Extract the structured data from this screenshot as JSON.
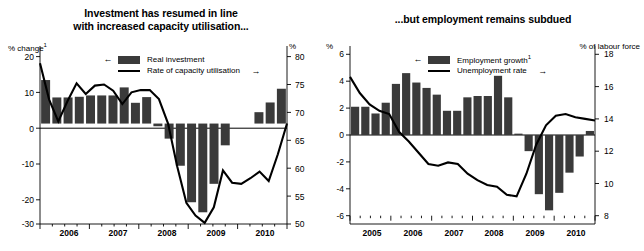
{
  "figure": {
    "background": "#ffffff",
    "bar_color": "#3a3a3a",
    "line_color": "#000000"
  },
  "chart_data": [
    {
      "type": "bar",
      "panel": "left",
      "title": "Investment has resumed in line with increased capacity utilisation...",
      "title_line1": "Investment has resumed in line",
      "title_line2": "with increased capacity utilisation...",
      "left_axis_label": "% change",
      "left_axis_label_sup": "1",
      "right_axis_label": "%",
      "left_ticks": [
        "20",
        "10",
        "0",
        "-10",
        "-20",
        "-30"
      ],
      "left_tick_values": [
        20,
        10,
        0,
        -10,
        -20,
        -30
      ],
      "right_ticks": [
        "80",
        "75",
        "70",
        "65",
        "60",
        "55",
        "50"
      ],
      "right_tick_values": [
        80,
        75,
        70,
        65,
        60,
        55,
        50
      ],
      "ylim": [
        -30,
        20
      ],
      "ylim_right": [
        50,
        80
      ],
      "xlabel": "",
      "grid": false,
      "legend_position": "top-center",
      "xtick_labels": [
        "2006",
        "2007",
        "2008",
        "2009",
        "2010"
      ],
      "legend": [
        {
          "name": "Real investment",
          "marker": "bar",
          "axis": "left",
          "arrow": "left"
        },
        {
          "name": "Rate of capacity utilisation",
          "marker": "line",
          "axis": "right",
          "arrow": "right"
        }
      ],
      "series": [
        {
          "name": "Real investment",
          "marker": "bar",
          "axis": "left",
          "unit": "% change",
          "values": [
            13.0,
            7.8,
            7.8,
            8.0,
            8.4,
            8.4,
            8.4,
            10.8,
            6.2,
            7.9,
            -0.8,
            -4.5,
            -12.6,
            -23.5,
            -26.5,
            -18.0,
            -6.5,
            0.0,
            0.0,
            3.4,
            6.3,
            10.4
          ]
        },
        {
          "name": "Rate of capacity utilisation",
          "marker": "line",
          "axis": "right",
          "unit": "%",
          "values": [
            78.8,
            72.3,
            68.4,
            72.0,
            75.2,
            73.3,
            74.8,
            75.0,
            73.9,
            71.5,
            73.6,
            74.0,
            74.0,
            72.4,
            68.0,
            60.3,
            53.8,
            51.5,
            50.2,
            53.0,
            59.6,
            57.4,
            57.2,
            58.2,
            59.4,
            57.7,
            62.5,
            68.0
          ]
        }
      ]
    },
    {
      "type": "bar",
      "panel": "right",
      "title": "...but employment remains subdued",
      "left_axis_label": "%",
      "right_axis_label": "% of labour force",
      "left_ticks": [
        "6",
        "4",
        "2",
        "0",
        "-2",
        "-4",
        "-6"
      ],
      "left_tick_values": [
        6,
        4,
        2,
        0,
        -2,
        -4,
        -6
      ],
      "right_ticks": [
        "18",
        "16",
        "14",
        "12",
        "10",
        "8"
      ],
      "right_tick_values": [
        18,
        16,
        14,
        12,
        10,
        8
      ],
      "ylim": [
        -6,
        6
      ],
      "ylim_right": [
        8,
        18
      ],
      "xlabel": "",
      "grid": false,
      "legend_position": "top-center",
      "xtick_labels": [
        "2005",
        "2006",
        "2007",
        "2008",
        "2009",
        "2010"
      ],
      "legend": [
        {
          "name": "Employment growth",
          "name_sup": "1",
          "marker": "bar",
          "axis": "left",
          "arrow": "left"
        },
        {
          "name": "Unemployment rate",
          "marker": "line",
          "axis": "right",
          "arrow": "right"
        }
      ],
      "series": [
        {
          "name": "Employment growth",
          "marker": "bar",
          "axis": "left",
          "unit": "%",
          "values": [
            2.1,
            2.1,
            1.6,
            2.4,
            3.8,
            4.6,
            3.9,
            3.5,
            3.0,
            1.8,
            1.8,
            2.8,
            2.9,
            2.9,
            4.4,
            2.8,
            0.1,
            -1.2,
            -4.4,
            -5.6,
            -4.3,
            -2.8,
            -1.6,
            0.3
          ]
        },
        {
          "name": "Unemployment rate",
          "marker": "line",
          "axis": "right",
          "unit": "% of labour force",
          "values": [
            16.6,
            15.6,
            14.9,
            14.5,
            14.3,
            13.2,
            12.6,
            11.9,
            11.2,
            11.1,
            11.3,
            11.2,
            10.6,
            10.2,
            9.9,
            9.8,
            9.3,
            9.2,
            10.6,
            12.4,
            13.6,
            14.2,
            14.3,
            14.1,
            14.0,
            13.9
          ]
        }
      ]
    }
  ]
}
